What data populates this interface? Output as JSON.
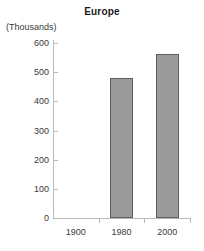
{
  "chart_data": {
    "type": "bar",
    "title": "Europe",
    "xlabel": "",
    "ylabel": "(Thousands)",
    "categories": [
      "1900",
      "1980",
      "2000"
    ],
    "values": [
      null,
      480,
      562
    ],
    "series": [
      {
        "name": "Europe",
        "values": [
          null,
          480,
          562
        ]
      }
    ],
    "ylim": [
      0,
      600
    ],
    "ytick_labels": [
      "0",
      "100",
      "200",
      "300",
      "400",
      "500",
      "600"
    ],
    "ytick_values": [
      0,
      100,
      200,
      300,
      400,
      500,
      600
    ],
    "grid": false,
    "legend": "none",
    "bar_fill_color": "#9b9b9b",
    "bar_border_color": "#5e5e5e",
    "axis_color": "#b9b9b9",
    "background_color": "#ffffff",
    "text_color": "#3a3a3a"
  }
}
